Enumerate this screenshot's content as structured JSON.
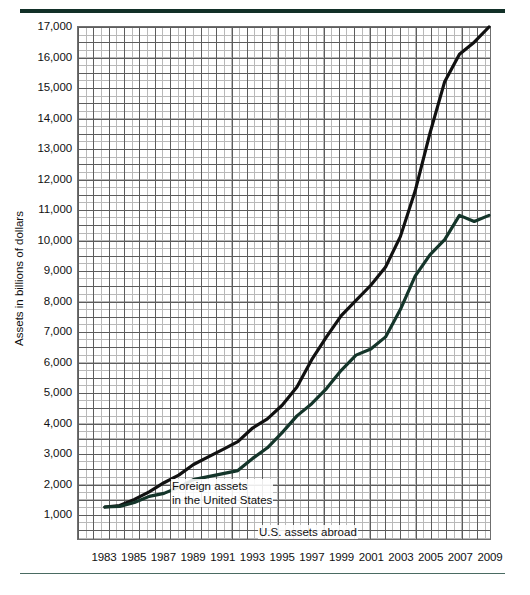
{
  "figure": {
    "top_rule_color": "#123028",
    "bottom_rule_color": "#4a6b62"
  },
  "axes": {
    "ylabel": "Assets in billions of dollars",
    "yticks": [
      "1,000",
      "2,000",
      "3,000",
      "4,000",
      "5,000",
      "6,000",
      "7,000",
      "8,000",
      "9,000",
      "10,000",
      "11,000",
      "12,000",
      "13,000",
      "14,000",
      "15,000",
      "16,000",
      "17,000"
    ],
    "xticks": [
      "1983",
      "1985",
      "1987",
      "1989",
      "1991",
      "1993",
      "1995",
      "1997",
      "1999",
      "2001",
      "2003",
      "2005",
      "2007",
      "2009"
    ]
  },
  "annotations": {
    "foreign_line1": "Foreign assets",
    "foreign_line2": "in the United States",
    "usa": "U.S. assets abroad"
  },
  "chart_data": {
    "type": "line",
    "title": "",
    "xlabel": "",
    "ylabel": "Assets in billions of dollars",
    "xlim": [
      1983,
      2009
    ],
    "ylim": [
      0,
      17000
    ],
    "ytick_values": [
      1000,
      2000,
      3000,
      4000,
      5000,
      6000,
      7000,
      8000,
      9000,
      10000,
      11000,
      12000,
      13000,
      14000,
      15000,
      16000,
      17000
    ],
    "xtick_values": [
      1983,
      1985,
      1987,
      1989,
      1991,
      1993,
      1995,
      1997,
      1999,
      2001,
      2003,
      2005,
      2007,
      2009
    ],
    "grid": true,
    "minor_grid": true,
    "legend": "inline-annotations",
    "x": [
      1983,
      1984,
      1985,
      1986,
      1987,
      1988,
      1989,
      1990,
      1991,
      1992,
      1993,
      1994,
      1995,
      1996,
      1997,
      1998,
      1999,
      2000,
      2001,
      2002,
      2003,
      2004,
      2005,
      2006,
      2007,
      2008,
      2009
    ],
    "series": [
      {
        "name": "Foreign assets in the United States",
        "color": "#111111",
        "values": [
          1200,
          1250,
          1450,
          1700,
          2000,
          2250,
          2600,
          2850,
          3100,
          3350,
          3800,
          4100,
          4550,
          5150,
          6050,
          6800,
          7500,
          8000,
          8500,
          9100,
          10100,
          11600,
          13500,
          15200,
          16100,
          16500,
          17000
        ]
      },
      {
        "name": "U.S. assets abroad",
        "color": "#14352a",
        "values": [
          1200,
          1220,
          1350,
          1550,
          1650,
          1850,
          2100,
          2200,
          2300,
          2400,
          2800,
          3150,
          3650,
          4200,
          4600,
          5100,
          5700,
          6200,
          6400,
          6800,
          7700,
          8800,
          9500,
          10000,
          10800,
          10600,
          10800
        ]
      }
    ]
  }
}
